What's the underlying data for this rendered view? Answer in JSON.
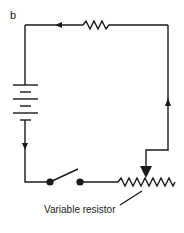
{
  "figure": {
    "panel_label": "b",
    "annotations": {
      "variable_resistor": "Variable resistor"
    },
    "components": [
      {
        "type": "battery",
        "cells": 3,
        "side": "left"
      },
      {
        "type": "resistor",
        "side": "top"
      },
      {
        "type": "switch",
        "state": "open",
        "side": "bottom"
      },
      {
        "type": "variable-resistor",
        "side": "bottom-right"
      }
    ],
    "current_arrows": [
      "top-wire-left",
      "left-wire-down",
      "right-wire-up"
    ],
    "colors": {
      "stroke": "#1a1a1a",
      "background": "#ffffff"
    }
  }
}
